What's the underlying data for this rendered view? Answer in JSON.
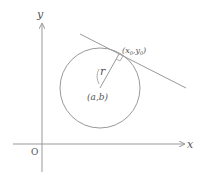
{
  "figure": {
    "type": "geometry-diagram"
  },
  "axes": {
    "x_label": "x",
    "y_label": "y",
    "origin_label": "O"
  },
  "circle": {
    "center_label": "(a,b)",
    "radius_label": "r"
  },
  "tangent": {
    "point_label_x": "x",
    "point_label_x_sub": "0",
    "point_label_sep": ",",
    "point_label_y": "y",
    "point_label_y_sub": "0"
  },
  "colors": {
    "stroke": "#888888",
    "text": "#555555",
    "background": "#ffffff"
  }
}
